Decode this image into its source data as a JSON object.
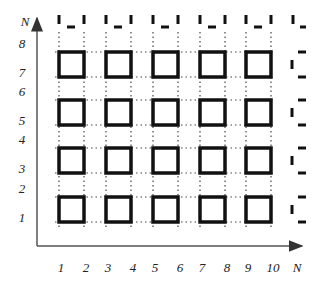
{
  "diagram": {
    "y_axis_label": "N",
    "x_axis_label": "N",
    "y_ticks": [
      "1",
      "2",
      "3",
      "4",
      "5",
      "6",
      "7",
      "8"
    ],
    "x_ticks": [
      "1",
      "2",
      "3",
      "4",
      "5",
      "6",
      "7",
      "8",
      "9",
      "10"
    ],
    "grid": {
      "cols": 5,
      "rows": 4,
      "description": "5x4 array of solid squares, each occupying a 2x2 block of cells, connected by dotted lines; dashed partial squares continue along top and right edges"
    },
    "colors": {
      "stroke": "#111111",
      "axis": "#555555",
      "dotted": "#444444"
    }
  }
}
